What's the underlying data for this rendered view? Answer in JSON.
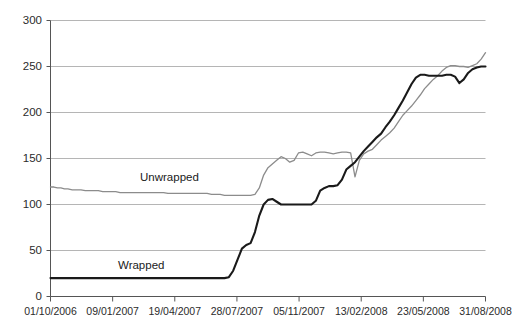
{
  "chart_data": {
    "type": "line",
    "title": "",
    "subtitle": "",
    "xlabel": "",
    "ylabel": "",
    "ylim": [
      0,
      300
    ],
    "yticks": [
      0,
      50,
      100,
      150,
      200,
      250,
      300
    ],
    "grid": true,
    "legend_position": "inline-annotation",
    "x_tick_labels": [
      "01/10/2006",
      "09/01/2007",
      "19/04/2007",
      "28/07/2007",
      "05/11/2007",
      "13/02/2008",
      "23/05/2008",
      "31/08/2008"
    ],
    "annotations": [
      {
        "text": "Unwrapped",
        "x_pixel": 140,
        "y_pixel": 171
      },
      {
        "text": "Wrapped",
        "x_pixel": 118,
        "y_pixel": 259
      }
    ],
    "colors": {
      "unwrapped": "#8c8c8c",
      "wrapped": "#1a1a1a",
      "grid": "#b5b5b5",
      "axis": "#555555"
    },
    "series": [
      {
        "name": "Unwrapped",
        "color": "#8c8c8c",
        "x": [
          0.0,
          0.8,
          1.6,
          2.4,
          3.2,
          4.0,
          5.0,
          6.0,
          7.0,
          8.0,
          9.0,
          10.0,
          11.0,
          12.0,
          13.0,
          14.0,
          15.0,
          16.0,
          17.0,
          18.0,
          19.0,
          20.0,
          21.0,
          22.0,
          23.0,
          24.0,
          25.0,
          26.0,
          27.0,
          28.0,
          29.0,
          30.0,
          31.0,
          32.0,
          33.0,
          34.0,
          35.0,
          36.0,
          37.0,
          38.0,
          39.0,
          40.0,
          41.0,
          42.0,
          43.0,
          44.0,
          45.0,
          46.0,
          47.0,
          48.0,
          49.0,
          50.0,
          51.0,
          52.0,
          53.0,
          54.0,
          55.0,
          56.0,
          57.0,
          58.0,
          59.0,
          60.0,
          61.0,
          62.0,
          63.0,
          64.0,
          65.0,
          66.0,
          67.0,
          68.0,
          69.0,
          70.0,
          71.0,
          72.0,
          73.0,
          74.0,
          75.0,
          76.0,
          77.0,
          78.0,
          79.0,
          80.0,
          81.0,
          82.0,
          83.0,
          84.0,
          85.0,
          86.0,
          87.0,
          88.0,
          89.0,
          90.0,
          91.0,
          92.0,
          93.0,
          94.0,
          95.0,
          96.0,
          97.0,
          98.0,
          99.0,
          100.0
        ],
        "values": [
          119,
          119,
          118,
          118,
          117,
          117,
          116,
          116,
          116,
          115,
          115,
          115,
          115,
          114,
          114,
          114,
          114,
          113,
          113,
          113,
          113,
          113,
          113,
          113,
          113,
          113,
          113,
          113,
          112,
          112,
          112,
          112,
          112,
          112,
          112,
          112,
          112,
          112,
          111,
          111,
          111,
          110,
          110,
          110,
          110,
          110,
          110,
          110,
          111,
          118,
          132,
          140,
          144,
          148,
          152,
          150,
          146,
          148,
          156,
          157,
          155,
          153,
          156,
          157,
          157,
          156,
          155,
          156,
          157,
          157,
          156,
          130,
          148,
          155,
          158,
          160,
          165,
          170,
          174,
          178,
          183,
          190,
          197,
          202,
          207,
          213,
          219,
          226,
          231,
          236,
          240,
          245,
          249,
          251,
          251,
          250,
          250,
          249,
          251,
          253,
          258,
          265
        ]
      },
      {
        "name": "Wrapped",
        "color": "#1a1a1a",
        "x": [
          0.0,
          1.0,
          2.0,
          3.0,
          4.0,
          5.0,
          6.0,
          7.0,
          8.0,
          9.0,
          10.0,
          11.0,
          12.0,
          13.0,
          14.0,
          15.0,
          16.0,
          17.0,
          18.0,
          19.0,
          20.0,
          21.0,
          22.0,
          23.0,
          24.0,
          25.0,
          26.0,
          27.0,
          28.0,
          29.0,
          30.0,
          31.0,
          32.0,
          33.0,
          34.0,
          35.0,
          36.0,
          37.0,
          38.0,
          39.0,
          40.0,
          41.0,
          42.0,
          43.0,
          44.0,
          45.0,
          46.0,
          47.0,
          48.0,
          49.0,
          50.0,
          51.0,
          52.0,
          53.0,
          54.0,
          55.0,
          56.0,
          57.0,
          58.0,
          59.0,
          60.0,
          61.0,
          62.0,
          63.0,
          64.0,
          65.0,
          66.0,
          67.0,
          68.0,
          69.0,
          70.0,
          71.0,
          72.0,
          73.0,
          74.0,
          75.0,
          76.0,
          77.0,
          78.0,
          79.0,
          80.0,
          81.0,
          82.0,
          83.0,
          84.0,
          85.0,
          86.0,
          87.0,
          88.0,
          89.0,
          90.0,
          91.0,
          92.0,
          93.0,
          94.0,
          95.0,
          96.0,
          97.0,
          98.0,
          99.0,
          100.0
        ],
        "values": [
          20,
          20,
          20,
          20,
          20,
          20,
          20,
          20,
          20,
          20,
          20,
          20,
          20,
          20,
          20,
          20,
          20,
          20,
          20,
          20,
          20,
          20,
          20,
          20,
          20,
          20,
          20,
          20,
          20,
          20,
          20,
          20,
          20,
          20,
          20,
          20,
          20,
          20,
          20,
          20,
          20,
          21,
          28,
          40,
          52,
          56,
          58,
          70,
          88,
          100,
          105,
          106,
          103,
          100,
          100,
          100,
          100,
          100,
          100,
          100,
          100,
          104,
          115,
          118,
          120,
          120,
          121,
          127,
          138,
          142,
          146,
          152,
          158,
          163,
          168,
          173,
          177,
          184,
          190,
          197,
          205,
          213,
          222,
          231,
          238,
          241,
          241,
          240,
          240,
          240,
          240,
          241,
          241,
          239,
          232,
          236,
          243,
          247,
          249,
          250,
          250
        ]
      }
    ]
  },
  "axes": {
    "y_tick_labels": [
      "300",
      "250",
      "200",
      "150",
      "100",
      "50",
      "0"
    ]
  }
}
